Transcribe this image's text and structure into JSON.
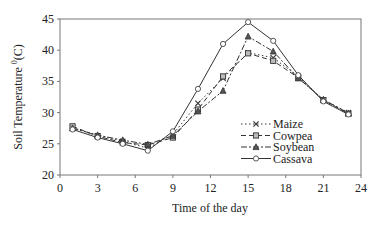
{
  "chart_data": {
    "type": "line",
    "title": "",
    "xlabel": "Time of the day",
    "ylabel": "Soil Temperature (°C)",
    "ylabel_parts": {
      "main": "Soil Temperature ",
      "sup": "0",
      "unit": "(C)"
    },
    "xlim": [
      0,
      24
    ],
    "ylim": [
      20,
      45
    ],
    "xticks": [
      0,
      3,
      6,
      9,
      12,
      15,
      18,
      21,
      24
    ],
    "yticks": [
      20,
      25,
      30,
      35,
      40,
      45
    ],
    "grid": false,
    "legend_position": "inside-right-lower",
    "x": [
      1,
      3,
      5,
      7,
      9,
      11,
      13,
      15,
      17,
      19,
      21,
      23
    ],
    "series": [
      {
        "name": "Maize",
        "marker": "x",
        "dash": "1.5,2.5",
        "values": [
          27.6,
          26.3,
          25.4,
          24.3,
          26.5,
          31.5,
          35.5,
          39.6,
          38.8,
          35.8,
          32.0,
          30.0
        ]
      },
      {
        "name": "Cowpea",
        "marker": "square",
        "dash": "5,3",
        "values": [
          27.8,
          26.2,
          25.2,
          24.8,
          26.0,
          30.5,
          35.8,
          39.5,
          38.3,
          35.6,
          32.0,
          29.8
        ]
      },
      {
        "name": "Soybean",
        "marker": "triangle",
        "dash": "6,2,2,2",
        "values": [
          27.5,
          26.4,
          25.6,
          24.9,
          26.3,
          30.2,
          33.5,
          42.2,
          39.8,
          35.5,
          32.1,
          29.9
        ]
      },
      {
        "name": "Cassava",
        "marker": "circle",
        "dash": "",
        "values": [
          27.3,
          26.0,
          25.0,
          23.9,
          27.0,
          33.8,
          41.0,
          44.5,
          41.5,
          36.0,
          31.8,
          29.7
        ]
      }
    ]
  }
}
